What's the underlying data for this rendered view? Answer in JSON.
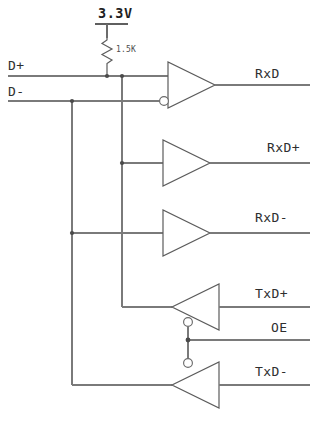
{
  "diagram": {
    "background_color": "#ffffff",
    "wire_color": "#7a7a7a",
    "gate_color": "#5c5c5c",
    "text_color": "#2e2e2e"
  },
  "supply": {
    "label": "3.3V",
    "rail_type": "power-rail-bar"
  },
  "resistor": {
    "value_label": "1.5K",
    "symbol": "zigzag",
    "connects_from": "3.3V",
    "connects_to": "D+"
  },
  "inputs": [
    {
      "id": "d_plus",
      "label": "D+"
    },
    {
      "id": "d_minus",
      "label": "D-"
    }
  ],
  "outputs": [
    {
      "id": "rxd",
      "label": "RxD"
    },
    {
      "id": "rxd_plus",
      "label": "RxD+"
    },
    {
      "id": "rxd_minus",
      "label": "RxD-"
    },
    {
      "id": "txd_plus",
      "label": "TxD+"
    },
    {
      "id": "oe",
      "label": "OE"
    },
    {
      "id": "txd_minus",
      "label": "TxD-"
    }
  ],
  "gates": [
    {
      "id": "comparator",
      "type": "differential-comparator",
      "direction": "right",
      "inverting_input_bubble": true,
      "enable_bubble": false,
      "output_label": "RxD",
      "inputs": [
        "D+",
        "D-"
      ]
    },
    {
      "id": "buffer_rxd_plus",
      "type": "buffer",
      "direction": "right",
      "inverting_input_bubble": false,
      "enable_bubble": false,
      "output_label": "RxD+",
      "inputs": [
        "D+"
      ]
    },
    {
      "id": "buffer_rxd_minus",
      "type": "buffer",
      "direction": "right",
      "inverting_input_bubble": false,
      "enable_bubble": false,
      "output_label": "RxD-",
      "inputs": [
        "D-"
      ]
    },
    {
      "id": "tristate_txd_plus",
      "type": "tristate-buffer",
      "direction": "left",
      "inverting_input_bubble": false,
      "enable_bubble": true,
      "enable_bubble_position": "bottom",
      "input_label": "TxD+",
      "enable": "OE",
      "drives": "D+"
    },
    {
      "id": "tristate_txd_minus",
      "type": "tristate-buffer",
      "direction": "left",
      "inverting_input_bubble": false,
      "enable_bubble": true,
      "enable_bubble_position": "top",
      "input_label": "TxD-",
      "enable": "OE",
      "drives": "D-"
    }
  ],
  "junction_count": 7
}
